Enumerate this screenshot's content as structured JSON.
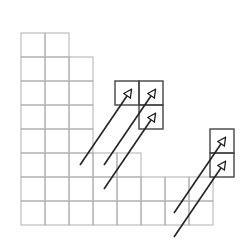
{
  "diagram": {
    "type": "young-diagram-with-arrows",
    "cell_size": 24,
    "origin": {
      "x": 21,
      "y": 33
    },
    "row_lengths": [
      2,
      3,
      3,
      3,
      3,
      5,
      8,
      8
    ],
    "grid_color": "#b0b0b0",
    "box_color": "#444444",
    "arrow_color": "#222222",
    "added_boxes": [
      {
        "x": 115,
        "y": 81
      },
      {
        "x": 139,
        "y": 81
      },
      {
        "x": 139,
        "y": 105
      },
      {
        "x": 210,
        "y": 129
      },
      {
        "x": 210,
        "y": 153
      }
    ],
    "arrows": [
      {
        "x1": 80,
        "y1": 165,
        "x2": 131,
        "y2": 90
      },
      {
        "x1": 104,
        "y1": 165,
        "x2": 155,
        "y2": 90
      },
      {
        "x1": 104,
        "y1": 189,
        "x2": 155,
        "y2": 114
      },
      {
        "x1": 174,
        "y1": 213,
        "x2": 225,
        "y2": 138
      },
      {
        "x1": 174,
        "y1": 237,
        "x2": 225,
        "y2": 162
      }
    ]
  }
}
